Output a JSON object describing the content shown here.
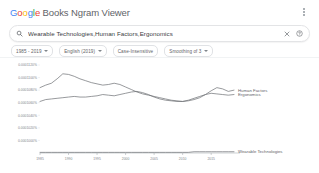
{
  "header": {
    "title_prefix": "Google",
    "title_rest": " Books Ngram Viewer",
    "letters": [
      "G",
      "o",
      "o",
      "g",
      "l",
      "e"
    ],
    "menu_icon": "kebab-menu-icon"
  },
  "search": {
    "icon": "search-icon",
    "value": "Wearable Technologies,Human Factors,Ergonomics",
    "placeholder": "Wearable Technologies,Human Factors,Ergonomics",
    "clear_icon": "close-icon",
    "help_icon": "help-circle-icon"
  },
  "chips": [
    {
      "label": "1985 - 2019",
      "has_caret": true,
      "name": "chip-year-range"
    },
    {
      "label": "English (2019)",
      "has_caret": true,
      "name": "chip-corpus"
    },
    {
      "label": "Case-Insensitive",
      "has_caret": false,
      "name": "chip-case-insensitive"
    },
    {
      "label": "Smoothing of 3",
      "has_caret": true,
      "name": "chip-smoothing"
    }
  ],
  "chart_data": {
    "type": "line",
    "title": "",
    "xlabel": "",
    "ylabel": "",
    "grid": false,
    "legend_position": "right-inline",
    "xlim": [
      1985,
      2019
    ],
    "ylim": [
      0,
      1.4e-05
    ],
    "x_ticks": [
      "1985",
      "1990",
      "1995",
      "2000",
      "2005",
      "2010",
      "2015"
    ],
    "x_tick_values": [
      1985,
      1990,
      1995,
      2000,
      2005,
      2010,
      2015
    ],
    "y_ticks": [
      "0.0001120%",
      "0.0001100%",
      "0.0001080%",
      "0.0001060%",
      "0.0001040%",
      "0.0001020%",
      "0.0001000%"
    ],
    "y_tick_values": [
      1.4e-05,
      1.2e-05,
      1e-05,
      8e-06,
      6e-06,
      4e-06,
      2e-06
    ],
    "x": [
      1985,
      1986,
      1987,
      1988,
      1989,
      1990,
      1991,
      1992,
      1993,
      1994,
      1995,
      1996,
      1997,
      1998,
      1999,
      2000,
      2001,
      2002,
      2003,
      2004,
      2005,
      2006,
      2007,
      2008,
      2009,
      2010,
      2011,
      2012,
      2013,
      2014,
      2015,
      2016,
      2017,
      2018,
      2019
    ],
    "series": [
      {
        "name": "Human Factors",
        "color": "#6b6f73",
        "values": [
          1.04e-05,
          1.08e-05,
          1.11e-05,
          1.18e-05,
          1.26e-05,
          1.25e-05,
          1.22e-05,
          1.18e-05,
          1.15e-05,
          1.12e-05,
          1.1e-05,
          1.08e-05,
          1.09e-05,
          1.11e-05,
          1.09e-05,
          1.05e-05,
          1.01e-05,
          9.7e-06,
          9.4e-06,
          9.2e-06,
          9e-06,
          8.8e-06,
          8.6e-06,
          8.4e-06,
          8.3e-06,
          8.2e-06,
          8.3e-06,
          8.5e-06,
          8.8e-06,
          9.3e-06,
          9.9e-06,
          1.04e-05,
          1.02e-05,
          9.8e-06,
          1e-05
        ]
      },
      {
        "name": "Ergonomics",
        "color": "#6b6f73",
        "values": [
          8.2e-06,
          8.5e-06,
          8.6e-06,
          8.7e-06,
          8.8e-06,
          8.9e-06,
          9e-06,
          8.9e-06,
          8.9e-06,
          9e-06,
          9.1e-06,
          9.3e-06,
          9.2e-06,
          9.1e-06,
          9.3e-06,
          9.5e-06,
          9.7e-06,
          9.8e-06,
          9.6e-06,
          9.3e-06,
          8.9e-06,
          8.6e-06,
          8.4e-06,
          8.3e-06,
          8.2e-06,
          8.2e-06,
          8.4e-06,
          8.7e-06,
          9e-06,
          9.3e-06,
          9.5e-06,
          9.4e-06,
          9.3e-06,
          9.2e-06,
          9.3e-06
        ]
      },
      {
        "name": "Wearable Technologies",
        "color": "#6b6f73",
        "values": [
          1e-07,
          1e-07,
          1e-07,
          1e-07,
          1e-07,
          1e-07,
          1e-07,
          1e-07,
          1e-07,
          1e-07,
          1e-07,
          1e-07,
          1e-07,
          1e-07,
          1e-07,
          1e-07,
          1e-07,
          1e-07,
          1e-07,
          1e-07,
          1e-07,
          1e-07,
          1e-07,
          1e-07,
          1e-07,
          1e-07,
          1e-07,
          2e-07,
          2e-07,
          2e-07,
          2e-07,
          2e-07,
          2e-07,
          2e-07,
          2e-07
        ]
      }
    ]
  }
}
